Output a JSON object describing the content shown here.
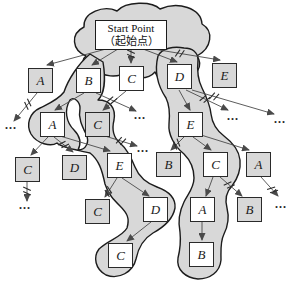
{
  "figure": {
    "kind": "beam-search-tree-diagram",
    "width": 296,
    "height": 283
  },
  "colors": {
    "background": "#ffffff",
    "blob_fill": "#d8d8d8",
    "blob_stroke": "#1c1c1c",
    "box_border": "#2a2a2a",
    "box_fill_in_beam": "#ffffff",
    "box_fill_pruned": "#d8d8d8",
    "arrow": "#4a4a4a",
    "prune_mark": "#2b2b2b",
    "text": "#1a1a1a"
  },
  "start_node": {
    "label_en": "Start Point",
    "label_zh": "（起始点）",
    "x": 95,
    "y": 20,
    "w": 72,
    "h": 30
  },
  "box_size": 25,
  "nodes": [
    {
      "label": "A",
      "x": 28,
      "y": 68,
      "in_beam": false
    },
    {
      "label": "B",
      "x": 76,
      "y": 68,
      "in_beam": true
    },
    {
      "label": "C",
      "x": 119,
      "y": 66,
      "in_beam": true
    },
    {
      "label": "D",
      "x": 167,
      "y": 64,
      "in_beam": true
    },
    {
      "label": "E",
      "x": 212,
      "y": 63,
      "in_beam": false
    },
    {
      "label": "A",
      "x": 40,
      "y": 112,
      "in_beam": true
    },
    {
      "label": "C",
      "x": 85,
      "y": 112,
      "in_beam": false
    },
    {
      "label": "E",
      "x": 178,
      "y": 112,
      "in_beam": true
    },
    {
      "label": "C",
      "x": 15,
      "y": 157,
      "in_beam": false
    },
    {
      "label": "D",
      "x": 62,
      "y": 155,
      "in_beam": false
    },
    {
      "label": "E",
      "x": 107,
      "y": 153,
      "in_beam": true
    },
    {
      "label": "B",
      "x": 156,
      "y": 152,
      "in_beam": false
    },
    {
      "label": "C",
      "x": 203,
      "y": 152,
      "in_beam": true
    },
    {
      "label": "A",
      "x": 246,
      "y": 152,
      "in_beam": false
    },
    {
      "label": "C",
      "x": 85,
      "y": 199,
      "in_beam": false
    },
    {
      "label": "D",
      "x": 143,
      "y": 197,
      "in_beam": true
    },
    {
      "label": "A",
      "x": 190,
      "y": 197,
      "in_beam": true
    },
    {
      "label": "B",
      "x": 237,
      "y": 197,
      "in_beam": false
    },
    {
      "label": "C",
      "x": 108,
      "y": 243,
      "in_beam": true
    },
    {
      "label": "B",
      "x": 189,
      "y": 242,
      "in_beam": true
    }
  ],
  "edges": [
    {
      "x1": 106,
      "y1": 49,
      "x2": 47,
      "y2": 65
    },
    {
      "x1": 118,
      "y1": 49,
      "x2": 92,
      "y2": 65
    },
    {
      "x1": 131,
      "y1": 49,
      "x2": 131,
      "y2": 63,
      "cut": 0.35
    },
    {
      "x1": 143,
      "y1": 49,
      "x2": 177,
      "y2": 62
    },
    {
      "x1": 153,
      "y1": 49,
      "x2": 220,
      "y2": 60,
      "cut": 0.4
    },
    {
      "x1": 37,
      "y1": 93,
      "x2": 14,
      "y2": 121,
      "cut": 0.4
    },
    {
      "x1": 84,
      "y1": 93,
      "x2": 55,
      "y2": 110
    },
    {
      "x1": 96,
      "y1": 93,
      "x2": 136,
      "y2": 111,
      "cut": 0.4
    },
    {
      "x1": 126,
      "y1": 91,
      "x2": 103,
      "y2": 110
    },
    {
      "x1": 179,
      "y1": 90,
      "x2": 190,
      "y2": 110
    },
    {
      "x1": 186,
      "y1": 90,
      "x2": 228,
      "y2": 110,
      "cut": 0.45
    },
    {
      "x1": 192,
      "y1": 90,
      "x2": 274,
      "y2": 114,
      "cut": 0.27
    },
    {
      "x1": 48,
      "y1": 137,
      "x2": 31,
      "y2": 155
    },
    {
      "x1": 54,
      "y1": 137,
      "x2": 73,
      "y2": 152,
      "cut": 0.5
    },
    {
      "x1": 60,
      "y1": 136,
      "x2": 110,
      "y2": 151
    },
    {
      "x1": 105,
      "y1": 136,
      "x2": 137,
      "y2": 146,
      "cut": 0.5
    },
    {
      "x1": 184,
      "y1": 137,
      "x2": 171,
      "y2": 150,
      "cut": 0.55
    },
    {
      "x1": 193,
      "y1": 137,
      "x2": 211,
      "y2": 150
    },
    {
      "x1": 201,
      "y1": 135,
      "x2": 249,
      "y2": 150
    },
    {
      "x1": 27,
      "y1": 181,
      "x2": 27,
      "y2": 201,
      "cut": 0.5
    },
    {
      "x1": 117,
      "y1": 178,
      "x2": 105,
      "y2": 197,
      "cut": 0.72
    },
    {
      "x1": 122,
      "y1": 178,
      "x2": 149,
      "y2": 196
    },
    {
      "x1": 213,
      "y1": 177,
      "x2": 206,
      "y2": 196
    },
    {
      "x1": 220,
      "y1": 177,
      "x2": 242,
      "y2": 196,
      "cut": 0.42
    },
    {
      "x1": 261,
      "y1": 177,
      "x2": 278,
      "y2": 196,
      "cut": 0.68
    },
    {
      "x1": 151,
      "y1": 222,
      "x2": 127,
      "y2": 241
    },
    {
      "x1": 202,
      "y1": 222,
      "x2": 202,
      "y2": 240
    }
  ],
  "ellipses": [
    {
      "text": "...",
      "x": 11,
      "y": 126
    },
    {
      "text": "...",
      "x": 140,
      "y": 116
    },
    {
      "text": "...",
      "x": 233,
      "y": 117
    },
    {
      "text": "...",
      "x": 280,
      "y": 120
    },
    {
      "text": "...",
      "x": 143,
      "y": 149
    },
    {
      "text": "...",
      "x": 25,
      "y": 206
    },
    {
      "text": "...",
      "x": 281,
      "y": 205
    }
  ],
  "beam_regions": [
    {
      "name": "head-region",
      "fill": "blob",
      "d": "M 86,56 C 72,50 70,34 84,27 C 83,12 104,5 117,11 C 126,1 152,1 160,9 C 178,1 201,8 202,24 C 214,31 212,48 197,56 C 204,66 196,78 184,77 C 175,85 159,83 155,72 C 148,80 133,80 127,71 C 118,79 102,77 95,68 C 85,67 80,61 86,56 Z"
    },
    {
      "name": "left-arm-region",
      "fill": "blob",
      "d": "M 90,54 C 78,64 68,80 64,92 C 58,100 48,104 40,108 C 29,113 26,125 31,134 C 37,144 51,147 57,143 C 62,148 78,150 90,153 C 99,160 102,170 105,184 C 108,194 114,200 120,206 C 127,213 130,218 127,228 C 122,237 108,240 99,249 C 93,257 95,269 106,275 C 119,280 133,272 136,259 C 138,249 143,239 153,233 C 164,227 173,219 175,208 C 176,197 168,191 157,187 C 146,183 139,177 135,167 C 131,157 127,149 120,143 C 113,137 112,128 114,120 C 116,108 110,100 98,100 C 104,94 106,80 103,62 Z"
    },
    {
      "name": "right-arm-region",
      "fill": "blob",
      "d": "M 158,56 C 154,72 158,86 166,98 C 170,106 170,114 169,124 C 168,134 174,146 184,154 C 191,161 194,168 194,178 C 194,188 188,194 184,202 C 179,212 178,222 180,232 C 181,242 180,250 178,258 C 176,270 186,278 198,279 C 210,279 220,272 221,260 C 221,250 220,242 224,234 C 228,226 229,216 227,208 C 225,200 226,192 232,186 C 238,178 241,170 240,160 C 239,150 232,142 224,136 C 216,130 212,122 211,114 C 210,104 206,96 202,88 C 198,80 197,70 198,60 C 198,52 192,48 184,48 C 174,46 162,48 158,56 Z"
    },
    {
      "name": "gap-sliver",
      "fill": "white",
      "d": "M 70,100 C 64,110 66,122 74,130 C 80,136 82,142 78,150 C 86,150 90,142 86,134 C 82,126 78,118 80,108 C 80,102 74,96 70,100 Z"
    }
  ]
}
